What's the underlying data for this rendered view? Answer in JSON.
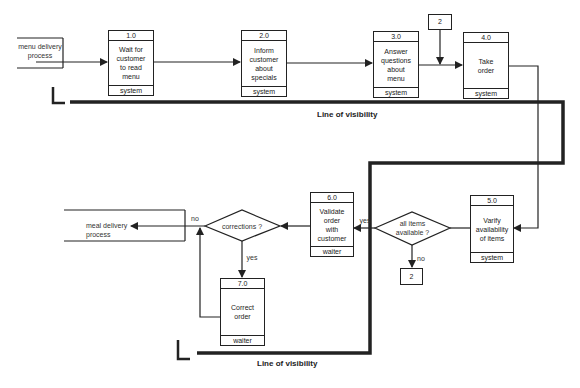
{
  "diagram": {
    "type": "service blueprint / process flow",
    "external_entities": [
      {
        "id": "start",
        "label": "menu delivery\nprocess"
      },
      {
        "id": "end",
        "label": "meal delivery\nprocess"
      }
    ],
    "processes": [
      {
        "id": "1.0",
        "number": "1.0",
        "label": "Wait for\ncustomer\nto read\nmenu",
        "role": "system"
      },
      {
        "id": "2.0",
        "number": "2.0",
        "label": "Inform\ncustomer\nabout\nspecials",
        "role": "system"
      },
      {
        "id": "3.0",
        "number": "3.0",
        "label": "Answer\nquestions\nabout\nmenu",
        "role": "system"
      },
      {
        "id": "4.0",
        "number": "4.0",
        "label": "Take\norder",
        "role": "system"
      },
      {
        "id": "5.0",
        "number": "5.0",
        "label": "Varify\navailability\nof items",
        "role": "system"
      },
      {
        "id": "6.0",
        "number": "6.0",
        "label": "Validate\norder\nwith\ncustomer",
        "role": "waiter"
      },
      {
        "id": "7.0",
        "number": "7.0",
        "label": "Correct\norder",
        "role": "waiter"
      }
    ],
    "decisions": [
      {
        "id": "d1",
        "label": "all items\navailable ?",
        "yes": "yes",
        "no": "no"
      },
      {
        "id": "d2",
        "label": "corrections ?",
        "yes": "yes",
        "no": "no"
      }
    ],
    "connectors": [
      {
        "id": "c_top",
        "label": "2"
      },
      {
        "id": "c_bottom",
        "label": "2"
      }
    ],
    "visibility_lines": [
      {
        "label": "Line of visibility"
      },
      {
        "label": "Line of visibility"
      }
    ],
    "edges": [
      {
        "from": "start",
        "to": "1.0"
      },
      {
        "from": "1.0",
        "to": "2.0"
      },
      {
        "from": "2.0",
        "to": "3.0"
      },
      {
        "from": "3.0",
        "to": "4.0"
      },
      {
        "from": "c_top",
        "to": "4.0"
      },
      {
        "from": "4.0",
        "to": "5.0"
      },
      {
        "from": "5.0",
        "to": "d1"
      },
      {
        "from": "d1",
        "to": "6.0",
        "label": "yes"
      },
      {
        "from": "d1",
        "to": "c_bottom",
        "label": "no"
      },
      {
        "from": "6.0",
        "to": "d2"
      },
      {
        "from": "d2",
        "to": "end",
        "label": "no"
      },
      {
        "from": "d2",
        "to": "7.0",
        "label": "yes"
      },
      {
        "from": "7.0",
        "to": "end"
      }
    ]
  }
}
